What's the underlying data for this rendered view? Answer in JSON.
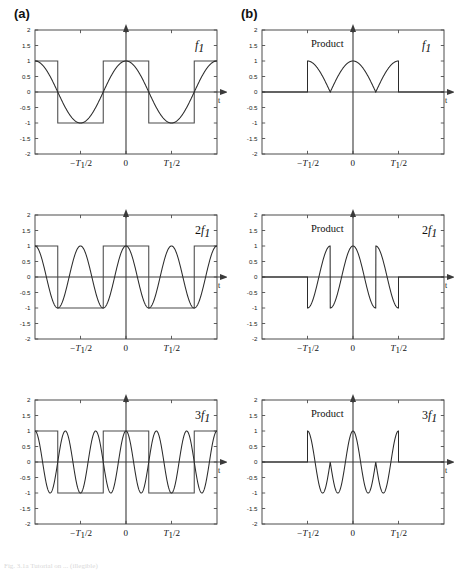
{
  "figure": {
    "panel_a_label": "(a)",
    "panel_b_label": "(b)",
    "caption": "Fig. 3.1a  Tutorial on ... (illegible)"
  },
  "axes": {
    "y_ticks": [
      "2",
      "1.5",
      "1",
      "0.5",
      "0",
      "-0.5",
      "-1",
      "-1.5",
      "-2"
    ],
    "y_tick_values": [
      2,
      1.5,
      1,
      0.5,
      0,
      -0.5,
      -1,
      -1.5,
      -2
    ],
    "ylim": [
      -2,
      2
    ],
    "xlim": [
      -1,
      1
    ],
    "x_tick_values": [
      -0.5,
      0,
      0.5
    ],
    "x_tick_labels": [
      "-T_1/2",
      "0",
      "T_1/2"
    ],
    "x_axis_label": "t",
    "x_minus_t_half": "−T",
    "x_minus_t_sub": "1",
    "x_minus_t_rest": "/2",
    "x_zero": "0",
    "x_plus_t_half": "T",
    "x_plus_t_sub": "1",
    "x_plus_t_rest": "/2"
  },
  "labels": {
    "product": "Product",
    "f_symbol": "f",
    "f_sub": "1",
    "two_prefix": "2",
    "three_prefix": "3"
  },
  "colors": {
    "frame": "#4d4d4d",
    "curve": "#2b2b2b",
    "square": "#4a4a4a",
    "axis": "#3a3a3a",
    "text": "#111111"
  },
  "chart_data": [
    {
      "type": "line",
      "panel": "a",
      "row": 1,
      "title": "",
      "signal_label": "f_1",
      "harmonic": 1,
      "xlabel": "t",
      "ylabel": "",
      "xlim": [
        -1,
        1
      ],
      "ylim": [
        -2,
        2
      ],
      "grid": false,
      "series": [
        {
          "name": "square wave at f1",
          "kind": "square",
          "frequency": 1,
          "amplitude": 1,
          "phase": 0,
          "description": "bipolar square wave, period T1, +1 at t=0"
        },
        {
          "name": "cosine at 1*f1",
          "kind": "cosine",
          "frequency": 1,
          "amplitude": 1,
          "phase": 0,
          "description": "cos(2*pi*t/T1)"
        }
      ]
    },
    {
      "type": "line",
      "panel": "b",
      "row": 1,
      "title": "Product",
      "signal_label": "f_1",
      "harmonic": 1,
      "xlabel": "t",
      "ylabel": "",
      "xlim": [
        -1,
        1
      ],
      "ylim": [
        -2,
        2
      ],
      "grid": false,
      "series": [
        {
          "name": "product square x cos(1*f1)",
          "kind": "product",
          "frequency": 1,
          "amplitude": 1,
          "window": [
            -0.5,
            0.5
          ],
          "description": "|cos| shaped positive lobes inside -T1/2..T1/2, zero outside"
        }
      ]
    },
    {
      "type": "line",
      "panel": "a",
      "row": 2,
      "title": "",
      "signal_label": "2f_1",
      "harmonic": 2,
      "xlabel": "t",
      "ylabel": "",
      "xlim": [
        -1,
        1
      ],
      "ylim": [
        -2,
        2
      ],
      "grid": false,
      "series": [
        {
          "name": "square wave at f1",
          "kind": "square",
          "frequency": 1,
          "amplitude": 1,
          "phase": 0
        },
        {
          "name": "cosine at 2*f1",
          "kind": "cosine",
          "frequency": 2,
          "amplitude": 1,
          "phase": 0
        }
      ]
    },
    {
      "type": "line",
      "panel": "b",
      "row": 2,
      "title": "Product",
      "signal_label": "2f_1",
      "harmonic": 2,
      "xlabel": "t",
      "ylabel": "",
      "xlim": [
        -1,
        1
      ],
      "ylim": [
        -2,
        2
      ],
      "grid": false,
      "series": [
        {
          "name": "product square x cos(2*f1)",
          "kind": "product",
          "frequency": 2,
          "amplitude": 1,
          "window": [
            -0.5,
            0.5
          ]
        }
      ]
    },
    {
      "type": "line",
      "panel": "a",
      "row": 3,
      "title": "",
      "signal_label": "3f_1",
      "harmonic": 3,
      "xlabel": "t",
      "ylabel": "",
      "xlim": [
        -1,
        1
      ],
      "ylim": [
        -2,
        2
      ],
      "grid": false,
      "series": [
        {
          "name": "square wave at f1",
          "kind": "square",
          "frequency": 1,
          "amplitude": 1,
          "phase": 0
        },
        {
          "name": "cosine at 3*f1",
          "kind": "cosine",
          "frequency": 3,
          "amplitude": 1,
          "phase": 0
        }
      ]
    },
    {
      "type": "line",
      "panel": "b",
      "row": 3,
      "title": "Product",
      "signal_label": "3f_1",
      "harmonic": 3,
      "xlabel": "t",
      "ylabel": "",
      "xlim": [
        -1,
        1
      ],
      "ylim": [
        -2,
        2
      ],
      "grid": false,
      "series": [
        {
          "name": "product square x cos(3*f1)",
          "kind": "product",
          "frequency": 3,
          "amplitude": 1,
          "window": [
            -0.5,
            0.5
          ]
        }
      ]
    }
  ]
}
